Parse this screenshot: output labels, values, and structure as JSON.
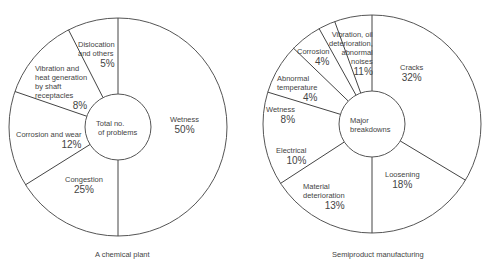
{
  "chart_data": [
    {
      "type": "pie",
      "variant": "donut",
      "title": "A chemical plant",
      "center_label": "Total no.\n of problems",
      "categories": [
        "Wetness",
        "Congestion",
        "Corrosion and wear",
        "Vibration and heat generation by shaft receptacles",
        "Dislocation and others"
      ],
      "values": [
        50,
        25,
        12,
        8,
        5
      ],
      "unit": "%",
      "geometry": {
        "cx": 118,
        "cy": 127,
        "r": 109,
        "inner_r": 33,
        "dividers_deg": [
          0,
          180,
          238,
          289,
          333
        ]
      },
      "labels": [
        {
          "text": "Wetness",
          "pct": "50%",
          "x": 170,
          "y": 115,
          "align": "center"
        },
        {
          "text": "Congestion",
          "pct": "25%",
          "x": 65,
          "y": 175,
          "align": "center"
        },
        {
          "text": "Corrosion and wear",
          "pct": "12%",
          "x": 16,
          "y": 130,
          "align": "left"
        },
        {
          "text": "Vibration and\nheat generation\nby shaft\nreceptacles",
          "pct": "8%",
          "x": 35,
          "y": 64,
          "align": "left"
        },
        {
          "text": "Dislocation\nand others",
          "pct": "5%",
          "x": 78,
          "y": 40,
          "align": "left"
        }
      ]
    },
    {
      "type": "pie",
      "variant": "donut",
      "title": "Semiproduct manufacturing",
      "center_label": "Major\nbreakdowns",
      "categories": [
        "Cracks",
        "Loosening",
        "Material deterioration",
        "Electrical",
        "Wetness",
        "Abnormal temperature",
        "Corrosion",
        "Vibration, oil deterioration, abnormal noises"
      ],
      "values": [
        32,
        18,
        13,
        10,
        8,
        4,
        4,
        11
      ],
      "unit": "%",
      "geometry": {
        "cx": 372,
        "cy": 124,
        "r": 109,
        "inner_r": 33,
        "dividers_deg": [
          0,
          120,
          180,
          238,
          285,
          252,
          0,
          0
        ],
        "divider_list_deg": [
          0,
          121,
          180,
          237,
          287,
          314,
          331,
          340
        ]
      },
      "labels": [
        {
          "text": "Cracks",
          "pct": "32%",
          "x": 400,
          "y": 63,
          "align": "center"
        },
        {
          "text": "Loosening",
          "pct": "18%",
          "x": 385,
          "y": 170,
          "align": "center"
        },
        {
          "text": "Material\ndeterioration",
          "pct": "13%",
          "x": 303,
          "y": 182,
          "align": "left"
        },
        {
          "text": "Electrical",
          "pct": "10%",
          "x": 276,
          "y": 146,
          "align": "left"
        },
        {
          "text": "Wetness",
          "pct": "8%",
          "x": 266,
          "y": 105,
          "align": "left"
        },
        {
          "text": "Abnormal\ntemperature",
          "pct": "4%",
          "x": 277,
          "y": 74,
          "align": "left"
        },
        {
          "text": "Corrosion",
          "pct": "4%",
          "x": 297,
          "y": 47,
          "align": "left"
        },
        {
          "text": "Vibration, oil\ndeterioration,\nabnormal\nnoises",
          "pct": "11%",
          "x": 329,
          "y": 30,
          "align": "right"
        }
      ]
    }
  ]
}
